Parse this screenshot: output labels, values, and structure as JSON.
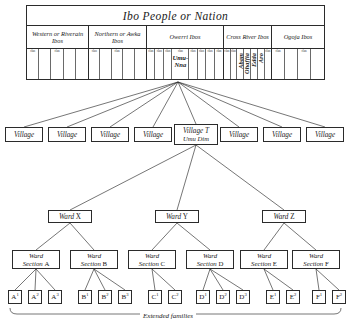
{
  "diagram": {
    "title": "Ibo People or Nation",
    "caption": "Extended families"
  },
  "table": {
    "nation_label": "Ibo People or Nation",
    "groups": [
      {
        "label": "Western or Riverain Ibos",
        "width": 62,
        "clans": 5,
        "tagged": [
          0,
          2
        ]
      },
      {
        "label": "Northern or Awka Ibos",
        "width": 58,
        "clans": 5,
        "tagged": [
          0,
          2
        ]
      },
      {
        "label": "Owerri Ibos",
        "width": 77,
        "clans": 8,
        "tagged": [
          0,
          1,
          2,
          3,
          4,
          5,
          6,
          7
        ],
        "named_index": 3,
        "named_line1": "Umu-",
        "named_line2": "Nna"
      },
      {
        "label": "Cross River Ibos",
        "width": 48,
        "clans": 7,
        "tagged": [
          0,
          1,
          2,
          3,
          4,
          5,
          6
        ],
        "vertical": [
          "Abam",
          "Ohaffia",
          "Edda",
          "Aro"
        ],
        "vertical_start": 2
      },
      {
        "label": "Ogoja Ibos",
        "width": 52,
        "clans": 4,
        "tagged": [
          0,
          2
        ]
      }
    ],
    "clan_tag": "clan"
  },
  "villages": [
    {
      "label": "Village"
    },
    {
      "label": "Village"
    },
    {
      "label": "Village"
    },
    {
      "label": "Village"
    },
    {
      "label": "Village T",
      "sub": "Umu Dim"
    },
    {
      "label": "Village"
    },
    {
      "label": "Village"
    },
    {
      "label": "Village"
    }
  ],
  "wards": [
    {
      "label": "Ward",
      "id": "X"
    },
    {
      "label": "Ward",
      "id": "Y"
    },
    {
      "label": "Ward",
      "id": "Z"
    }
  ],
  "ward_sections": [
    {
      "l1": "Ward",
      "l2": "Section",
      "id": "A"
    },
    {
      "l1": "Ward",
      "l2": "Section",
      "id": "B"
    },
    {
      "l1": "Ward",
      "l2": "Section",
      "id": "C"
    },
    {
      "l1": "Ward",
      "l2": "Section",
      "id": "D"
    },
    {
      "l1": "Ward",
      "l2": "Section",
      "id": "E"
    },
    {
      "l1": "Ward",
      "l2": "Section",
      "id": "F"
    }
  ],
  "families": [
    {
      "letter": "A",
      "num": "1"
    },
    {
      "letter": "A",
      "num": "2"
    },
    {
      "letter": "A",
      "num": "3"
    },
    {
      "letter": "B",
      "num": "1"
    },
    {
      "letter": "B",
      "num": "2"
    },
    {
      "letter": "B",
      "num": "3"
    },
    {
      "letter": "C",
      "num": "1"
    },
    {
      "letter": "C",
      "num": "2"
    },
    {
      "letter": "D",
      "num": "1"
    },
    {
      "letter": "D",
      "num": "2"
    },
    {
      "letter": "D",
      "num": "3"
    },
    {
      "letter": "E",
      "num": "1"
    },
    {
      "letter": "E",
      "num": "2"
    },
    {
      "letter": "F",
      "num": "1"
    },
    {
      "letter": "F",
      "num": "2"
    }
  ],
  "colors": {
    "ink": "#2b2b2b",
    "paper": "#ffffff",
    "rule_light": "#6a6a6a"
  }
}
